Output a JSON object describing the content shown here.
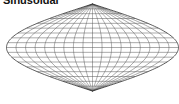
{
  "title": "Sinusoidal",
  "projection": {
    "name": "sinusoidal",
    "meridian_step_deg": 20,
    "parallel_step_deg": 10,
    "line_color": "#555555",
    "outline_color": "#333333"
  }
}
